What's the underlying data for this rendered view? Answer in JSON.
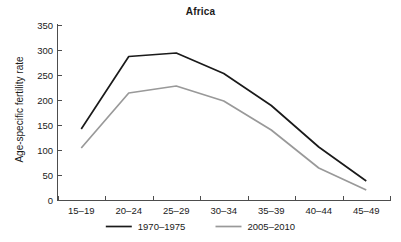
{
  "chart_data": {
    "type": "line",
    "title": "Africa",
    "xlabel": "",
    "ylabel": "Age-specific fertility rate",
    "categories": [
      "15–19",
      "20–24",
      "25–29",
      "30–34",
      "35–39",
      "40–44",
      "45–49"
    ],
    "ylim": [
      0,
      350
    ],
    "yticks": [
      0,
      50,
      100,
      150,
      200,
      250,
      300,
      350
    ],
    "ytick_labels": [
      "0",
      "50",
      "100",
      "150",
      "200",
      "250",
      "300",
      "350"
    ],
    "grid": false,
    "legend_position": "bottom",
    "series": [
      {
        "name": "1970–1975",
        "color": "#1a1a1a",
        "values": [
          142,
          287,
          294,
          253,
          189,
          106,
          38
        ]
      },
      {
        "name": "2005–2010",
        "color": "#999999",
        "values": [
          104,
          214,
          228,
          198,
          140,
          64,
          20
        ]
      }
    ]
  },
  "legend": {
    "items": [
      {
        "label": "1970–1975",
        "color": "#1a1a1a"
      },
      {
        "label": "2005–2010",
        "color": "#999999"
      }
    ]
  },
  "colors": {
    "axis": "#4d4d4d",
    "text": "#1a1a1a",
    "background": "#ffffff",
    "series_primary": "#1a1a1a",
    "series_secondary": "#999999"
  }
}
